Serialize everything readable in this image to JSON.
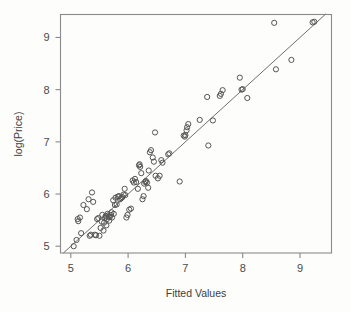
{
  "chart_data": {
    "type": "scatter",
    "title": "",
    "xlabel": "Fitted Values",
    "ylabel": "log(Price)",
    "xlim": [
      4.82,
      9.55
    ],
    "ylim": [
      4.87,
      9.44
    ],
    "xticks": [
      5,
      6,
      7,
      8,
      9
    ],
    "yticks": [
      5,
      6,
      7,
      8,
      9
    ],
    "xtick_labels": [
      "5",
      "6",
      "7",
      "8",
      "9"
    ],
    "ytick_labels": [
      "5",
      "6",
      "7",
      "8",
      "9"
    ],
    "grid": false,
    "legend": null,
    "annotations": [],
    "reference_line": {
      "name": "identity-line",
      "description": "y = x diagonal reference line",
      "x": [
        4.87,
        9.45
      ],
      "y": [
        4.87,
        9.45
      ]
    },
    "series": [
      {
        "name": "observations",
        "marker": "open-circle",
        "color": "#555555",
        "points": [
          [
            5.05,
            5.0
          ],
          [
            5.1,
            5.12
          ],
          [
            5.12,
            5.52
          ],
          [
            5.13,
            5.48
          ],
          [
            5.16,
            5.55
          ],
          [
            5.18,
            5.25
          ],
          [
            5.22,
            5.79
          ],
          [
            5.28,
            5.71
          ],
          [
            5.31,
            5.9
          ],
          [
            5.33,
            5.2
          ],
          [
            5.35,
            5.22
          ],
          [
            5.37,
            6.03
          ],
          [
            5.39,
            5.85
          ],
          [
            5.42,
            5.22
          ],
          [
            5.44,
            5.21
          ],
          [
            5.46,
            5.52
          ],
          [
            5.48,
            5.54
          ],
          [
            5.5,
            5.2
          ],
          [
            5.52,
            5.35
          ],
          [
            5.54,
            5.47
          ],
          [
            5.55,
            5.6
          ],
          [
            5.57,
            5.3
          ],
          [
            5.58,
            5.45
          ],
          [
            5.6,
            5.55
          ],
          [
            5.61,
            5.58
          ],
          [
            5.62,
            5.4
          ],
          [
            5.63,
            5.52
          ],
          [
            5.64,
            5.62
          ],
          [
            5.66,
            5.57
          ],
          [
            5.67,
            5.49
          ],
          [
            5.68,
            5.56
          ],
          [
            5.7,
            5.6
          ],
          [
            5.71,
            5.65
          ],
          [
            5.72,
            5.55
          ],
          [
            5.74,
            5.88
          ],
          [
            5.75,
            5.62
          ],
          [
            5.77,
            5.79
          ],
          [
            5.78,
            5.93
          ],
          [
            5.8,
            5.8
          ],
          [
            5.82,
            5.95
          ],
          [
            5.84,
            5.96
          ],
          [
            5.86,
            5.9
          ],
          [
            5.88,
            5.92
          ],
          [
            5.9,
            5.94
          ],
          [
            5.92,
            5.99
          ],
          [
            5.94,
            6.1
          ],
          [
            5.95,
            5.98
          ],
          [
            5.97,
            5.55
          ],
          [
            5.99,
            5.6
          ],
          [
            6.02,
            5.7
          ],
          [
            6.05,
            5.72
          ],
          [
            6.08,
            6.26
          ],
          [
            6.1,
            6.22
          ],
          [
            6.12,
            6.29
          ],
          [
            6.14,
            6.23
          ],
          [
            6.17,
            6.1
          ],
          [
            6.19,
            6.55
          ],
          [
            6.2,
            6.57
          ],
          [
            6.21,
            6.52
          ],
          [
            6.23,
            6.4
          ],
          [
            6.25,
            5.9
          ],
          [
            6.27,
            5.96
          ],
          [
            6.28,
            6.2
          ],
          [
            6.3,
            6.23
          ],
          [
            6.31,
            6.25
          ],
          [
            6.33,
            6.22
          ],
          [
            6.35,
            6.12
          ],
          [
            6.36,
            6.45
          ],
          [
            6.38,
            6.8
          ],
          [
            6.4,
            6.84
          ],
          [
            6.43,
            6.7
          ],
          [
            6.45,
            6.62
          ],
          [
            6.47,
            7.18
          ],
          [
            6.48,
            6.35
          ],
          [
            6.52,
            6.3
          ],
          [
            6.55,
            6.35
          ],
          [
            6.58,
            6.65
          ],
          [
            6.6,
            6.6
          ],
          [
            6.7,
            6.76
          ],
          [
            6.72,
            6.78
          ],
          [
            6.9,
            6.24
          ],
          [
            6.97,
            7.12
          ],
          [
            6.99,
            7.1
          ],
          [
            7.0,
            7.13
          ],
          [
            7.02,
            7.22
          ],
          [
            7.03,
            7.28
          ],
          [
            7.05,
            7.34
          ],
          [
            7.25,
            7.42
          ],
          [
            7.38,
            7.86
          ],
          [
            7.4,
            6.93
          ],
          [
            7.48,
            7.41
          ],
          [
            7.6,
            7.88
          ],
          [
            7.62,
            7.92
          ],
          [
            7.65,
            7.99
          ],
          [
            7.95,
            8.23
          ],
          [
            7.98,
            8.0
          ],
          [
            8.0,
            8.01
          ],
          [
            8.08,
            7.84
          ],
          [
            8.55,
            9.28
          ],
          [
            8.58,
            8.39
          ],
          [
            8.85,
            8.57
          ],
          [
            9.22,
            9.29
          ],
          [
            9.25,
            9.3
          ]
        ]
      }
    ]
  }
}
